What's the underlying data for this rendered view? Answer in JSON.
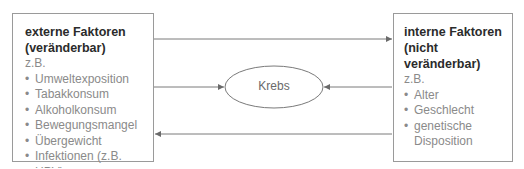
{
  "left_box": {
    "title_line1": "externe Faktoren",
    "title_line2": "(veränderbar)",
    "example_label": "z.B.",
    "items": [
      "Umweltexposition",
      "Tabakkonsum",
      "Alkoholkonsum",
      "Bewegungsmangel",
      "Übergewicht",
      "Infektionen (z.B. HPV)"
    ]
  },
  "center": {
    "label": "Krebs"
  },
  "right_box": {
    "title_line1": "interne Faktoren",
    "title_line2": "(nicht veränderbar)",
    "example_label": "z.B.",
    "items": [
      "Alter",
      "Geschlecht",
      "genetische Disposition"
    ]
  },
  "colors": {
    "line": "#7a7a7a",
    "border": "#9a9a9a",
    "title": "#2b2b2b",
    "text": "#8a8a8a"
  }
}
